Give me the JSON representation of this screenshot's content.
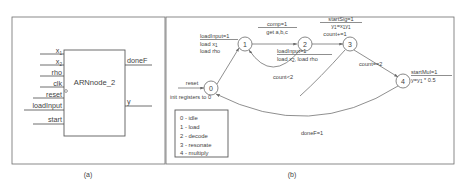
{
  "figure": {
    "panels": [
      {
        "id": "a",
        "caption": "(a)"
      },
      {
        "id": "b",
        "caption": "(b)"
      }
    ]
  },
  "block_diagram": {
    "module_name": "ARNnode_2",
    "inputs": [
      {
        "label": "x",
        "subscript": "1"
      },
      {
        "label": "x",
        "subscript": "2"
      },
      {
        "label": "rho",
        "subscript": ""
      },
      {
        "label": "clk",
        "subscript": ""
      },
      {
        "label": "reset",
        "subscript": ""
      },
      {
        "label": "loadInput",
        "subscript": ""
      },
      {
        "label": "start",
        "subscript": ""
      }
    ],
    "outputs": [
      {
        "label": "doneF"
      },
      {
        "label": "y"
      }
    ]
  },
  "fsm": {
    "states": [
      {
        "id": "0",
        "label": "0"
      },
      {
        "id": "1",
        "label": "1"
      },
      {
        "id": "2",
        "label": "2"
      },
      {
        "id": "3",
        "label": "3"
      },
      {
        "id": "4",
        "label": "4"
      }
    ],
    "reset_label": "reset",
    "init_label": "init registers to 0",
    "transitions": [
      {
        "from": "0",
        "to": "1",
        "lines": [
          "loadInput=1",
          "load x1",
          "load rho"
        ]
      },
      {
        "from": "1",
        "to": "2",
        "lines": [
          "comp=1",
          "get a,b,c"
        ]
      },
      {
        "from": "2",
        "to": "1",
        "lines": [
          "loadInput=1",
          "load x2, load rho"
        ]
      },
      {
        "from": "2",
        "to": "1",
        "condition": "count<2"
      },
      {
        "from": "2",
        "to": "3",
        "lines": [
          "startSig=1",
          "y1=x1y1",
          "count+=1"
        ]
      },
      {
        "from": "3",
        "to": "4",
        "condition": "count==2"
      },
      {
        "from": "4",
        "to": "0",
        "lines": [
          "startMul=1",
          "y=y1 * 0.5"
        ]
      },
      {
        "from": "4",
        "to": "0",
        "condition": "doneF=1"
      }
    ],
    "legend": {
      "entries": [
        "0 - idle",
        "1 - load",
        "2 - decode",
        "3 - resonate",
        "4 - multiply"
      ]
    }
  }
}
